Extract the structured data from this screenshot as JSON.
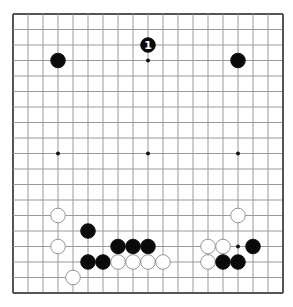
{
  "board": {
    "size": 19,
    "origin_x": 13,
    "origin_y": 14,
    "step_x": 15,
    "step_y": 15.5,
    "colors": {
      "background": "#ffffff",
      "border": "#555555",
      "grid": "#9a9a9a",
      "star": "#111111",
      "black_stone": "#0a0a0a",
      "white_stone": "#ffffff",
      "white_stone_outline": "#888888",
      "marker_on_black": "#ffffff"
    },
    "star_points": [
      [
        3,
        3
      ],
      [
        9,
        3
      ],
      [
        15,
        3
      ],
      [
        3,
        9
      ],
      [
        9,
        9
      ],
      [
        15,
        9
      ],
      [
        3,
        15
      ],
      [
        9,
        15
      ],
      [
        15,
        15
      ]
    ],
    "stones": [
      {
        "color": "black",
        "col": 3,
        "row": 3
      },
      {
        "color": "black",
        "col": 9,
        "row": 2,
        "label": "1"
      },
      {
        "color": "black",
        "col": 15,
        "row": 3
      },
      {
        "color": "white",
        "col": 3,
        "row": 13
      },
      {
        "color": "black",
        "col": 5,
        "row": 14
      },
      {
        "color": "white",
        "col": 3,
        "row": 15
      },
      {
        "color": "black",
        "col": 7,
        "row": 15
      },
      {
        "color": "black",
        "col": 8,
        "row": 15
      },
      {
        "color": "black",
        "col": 9,
        "row": 15
      },
      {
        "color": "black",
        "col": 5,
        "row": 16
      },
      {
        "color": "black",
        "col": 6,
        "row": 16
      },
      {
        "color": "white",
        "col": 7,
        "row": 16
      },
      {
        "color": "white",
        "col": 8,
        "row": 16
      },
      {
        "color": "white",
        "col": 9,
        "row": 16
      },
      {
        "color": "white",
        "col": 10,
        "row": 16
      },
      {
        "color": "white",
        "col": 4,
        "row": 17
      },
      {
        "color": "white",
        "col": 15,
        "row": 13
      },
      {
        "color": "white",
        "col": 13,
        "row": 15
      },
      {
        "color": "white",
        "col": 14,
        "row": 15
      },
      {
        "color": "black",
        "col": 16,
        "row": 15
      },
      {
        "color": "white",
        "col": 13,
        "row": 16
      },
      {
        "color": "black",
        "col": 14,
        "row": 16
      },
      {
        "color": "black",
        "col": 15,
        "row": 16
      }
    ]
  }
}
